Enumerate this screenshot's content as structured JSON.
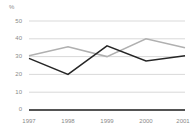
{
  "chart_data": {
    "type": "line",
    "title": "",
    "xlabel": "",
    "ylabel": "%",
    "y_unit": "%",
    "categories": [
      "1997",
      "1998",
      "1999",
      "2000",
      "2001"
    ],
    "x": [
      1997,
      1998,
      1999,
      2000,
      2001
    ],
    "ylim": [
      0,
      50
    ],
    "y_ticks": [
      0,
      10,
      20,
      30,
      40,
      50
    ],
    "y_tick_labels": [
      "0",
      "10",
      "20",
      "30",
      "40",
      "50"
    ],
    "x_tick_labels": [
      "1997",
      "1998",
      "1999",
      "2000",
      "2001"
    ],
    "grid": true,
    "grid_axis": "y",
    "legend": false,
    "legend_position": "none",
    "series": [
      {
        "name": "series-dark",
        "color": "#262626",
        "values": [
          29,
          20,
          36,
          27.5,
          30.5
        ]
      },
      {
        "name": "series-gray",
        "color": "#b0b0b0",
        "values": [
          30.5,
          35.5,
          30,
          40,
          35
        ]
      }
    ]
  },
  "colors": {
    "background": "#ffffff",
    "gridline": "#c9c9c9",
    "axis": "#1a1a1a",
    "tick_text": "#8a8a8a",
    "series_dark": "#262626",
    "series_gray": "#b0b0b0"
  }
}
